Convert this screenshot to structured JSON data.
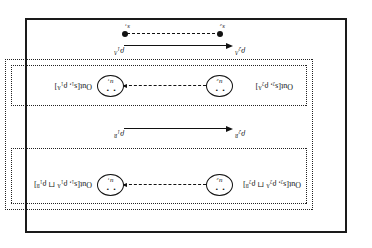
{
  "figure": {
    "orientation_note": "scan-rotated-180",
    "outer_frame": {
      "name": "outer-solid-frame"
    },
    "upper_section": {
      "out_label_right": "Out[s₁, ρ₁ᴬ ⊓ ρ₁ᴮ]",
      "out_label_left": "Out[s₂, ρ₂ᴬ ⊓ ρ₂ᴮ]",
      "node_right": "u₁",
      "node_left": "u₂",
      "node_glyph": "• •"
    },
    "middle_transition": {
      "from": "ρ₁ᴮ",
      "to": "ρ₂ᴮ"
    },
    "lower_section": {
      "out_label_right": "Out[s₁, ρ₁ᴬ]",
      "out_label_left": "Out[s₂, ρ₂ᴬ]",
      "node_right": "u₁",
      "node_left": "u₂",
      "node_glyph": "• •"
    },
    "bottom_transition": {
      "from": "ρ₁ᴬ",
      "to": "ρ₂ᴬ"
    },
    "bottom_states": {
      "right": "s₁",
      "left": "s₂"
    },
    "colors": {
      "ink": "#111111",
      "frame": "#1a1a1a",
      "background": "#ffffff"
    }
  }
}
